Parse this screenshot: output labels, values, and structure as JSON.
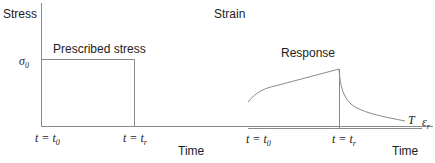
{
  "left_panel": {
    "y_label": "Stress",
    "x_label": "Time",
    "curve_label": "Prescribed stress",
    "level_label": "σ",
    "level_sub": "0",
    "tick_start": "t = t",
    "tick_start_sub": "0",
    "tick_end": "t = t",
    "tick_end_sub": "r"
  },
  "right_panel": {
    "y_label": "Strain",
    "x_label": "Time",
    "curve_label": "Response",
    "end_label": "T",
    "eps_label": "ε",
    "eps_sub": "r",
    "tick_start": "t = t",
    "tick_start_sub": "0",
    "tick_end": "t = t",
    "tick_end_sub": "r"
  },
  "colors": {
    "line": "#8a8a8a",
    "text": "#222222"
  }
}
